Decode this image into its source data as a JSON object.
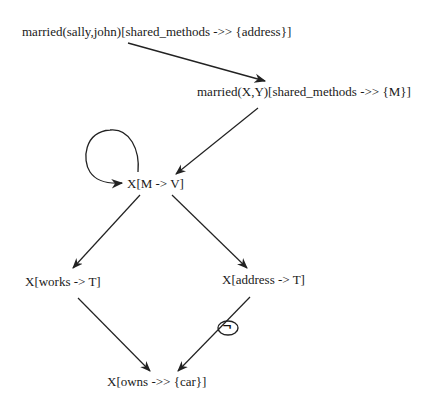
{
  "diagram": {
    "type": "directed-graph",
    "nodes": {
      "n1": {
        "label": "married(sally,john)[shared_methods ->> {address}]"
      },
      "n2": {
        "label": "married(X,Y)[shared_methods ->> {M}]"
      },
      "n3": {
        "label": "X[M -> V]"
      },
      "n4": {
        "label": "X[works -> T]"
      },
      "n5": {
        "label": "X[address -> T]"
      },
      "n6": {
        "label": "X[owns ->> {car}]"
      }
    },
    "edges": [
      {
        "from": "married(sally,john)[shared_methods ->> {address}]",
        "to": "married(X,Y)[shared_methods ->> {M}]"
      },
      {
        "from": "married(X,Y)[shared_methods ->> {M}]",
        "to": "X[M -> V]"
      },
      {
        "from": "X[M -> V]",
        "to": "X[M -> V]",
        "kind": "self-loop"
      },
      {
        "from": "X[M -> V]",
        "to": "X[works -> T]"
      },
      {
        "from": "X[M -> V]",
        "to": "X[address -> T]"
      },
      {
        "from": "X[works -> T]",
        "to": "X[owns ->> {car}]"
      },
      {
        "from": "X[address -> T]",
        "to": "X[owns ->> {car}]",
        "annotation": "negation"
      }
    ],
    "negation_symbol": "¬",
    "colors": {
      "edge": "#222222",
      "text": "#1a1a1a",
      "background": "#ffffff"
    }
  }
}
